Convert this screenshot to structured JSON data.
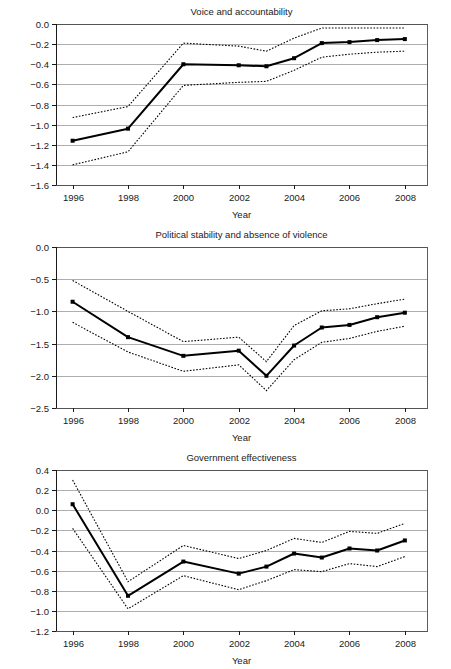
{
  "figure": {
    "background": "#ffffff",
    "line_color": "#000000",
    "grid_color": "#8c8c8c",
    "frame_color": "#4a4a4a"
  },
  "panels": [
    {
      "name": "voice-and-accountability",
      "title": "Voice and accountability",
      "xlabel": "Year",
      "yticks": [
        "0.0",
        "-0.2",
        "-0.4",
        "-0.6",
        "-0.8",
        "-1.0",
        "-1.2",
        "-1.4",
        "-1.6"
      ],
      "xticks": [
        "1996",
        "1998",
        "2000",
        "2002",
        "2004",
        "2006",
        "2008"
      ]
    },
    {
      "name": "political-stability-and-absence-of-violence",
      "title": "Political stability and absence of violence",
      "xlabel": "Year",
      "yticks": [
        "0.0",
        "-0.5",
        "-1.0",
        "-1.5",
        "-2.0",
        "-2.5"
      ],
      "xticks": [
        "1996",
        "1998",
        "2000",
        "2002",
        "2004",
        "2006",
        "2008"
      ]
    },
    {
      "name": "government-effectiveness",
      "title": "Government effectiveness",
      "xlabel": "Year",
      "yticks": [
        "0.4",
        "0.2",
        "0.0",
        "-0.2",
        "-0.4",
        "-0.6",
        "-0.8",
        "-1.0",
        "-1.2"
      ],
      "xticks": [
        "1996",
        "1998",
        "2000",
        "2002",
        "2004",
        "2006",
        "2008"
      ]
    }
  ],
  "chart_data": [
    {
      "type": "line",
      "title": "Voice and accountability",
      "xlabel": "Year",
      "ylabel": "",
      "xlim": [
        1995.4,
        2008.8
      ],
      "ylim": [
        -1.6,
        0.0
      ],
      "yticks": [
        0.0,
        -0.2,
        -0.4,
        -0.6,
        -0.8,
        -1.0,
        -1.2,
        -1.4,
        -1.6
      ],
      "xticks": [
        1996,
        1998,
        2000,
        2002,
        2004,
        2006,
        2008
      ],
      "grid": true,
      "legend": "none",
      "x": [
        1996,
        1998,
        2000,
        2002,
        2003,
        2004,
        2005,
        2006,
        2007,
        2008
      ],
      "series": [
        {
          "name": "Estimate",
          "style": "solid",
          "markers": true,
          "values": [
            -1.16,
            -1.04,
            -0.4,
            -0.41,
            -0.42,
            -0.34,
            -0.19,
            -0.18,
            -0.16,
            -0.15
          ]
        },
        {
          "name": "Upper confidence bound",
          "style": "dotted",
          "markers": false,
          "values": [
            -0.93,
            -0.82,
            -0.19,
            -0.22,
            -0.27,
            -0.14,
            -0.04,
            -0.04,
            -0.04,
            -0.04
          ]
        },
        {
          "name": "Lower confidence bound",
          "style": "dotted",
          "markers": false,
          "values": [
            -1.4,
            -1.27,
            -0.61,
            -0.58,
            -0.57,
            -0.46,
            -0.33,
            -0.3,
            -0.28,
            -0.27
          ]
        }
      ]
    },
    {
      "type": "line",
      "title": "Political stability and absence of violence",
      "xlabel": "Year",
      "ylabel": "",
      "xlim": [
        1995.4,
        2008.8
      ],
      "ylim": [
        -2.5,
        0.0
      ],
      "yticks": [
        0.0,
        -0.5,
        -1.0,
        -1.5,
        -2.0,
        -2.5
      ],
      "xticks": [
        1996,
        1998,
        2000,
        2002,
        2004,
        2006,
        2008
      ],
      "grid": true,
      "legend": "none",
      "x": [
        1996,
        1998,
        2000,
        2002,
        2003,
        2004,
        2005,
        2006,
        2007,
        2008
      ],
      "series": [
        {
          "name": "Estimate",
          "style": "solid",
          "markers": true,
          "values": [
            -0.85,
            -1.4,
            -1.69,
            -1.61,
            -2.0,
            -1.53,
            -1.25,
            -1.21,
            -1.09,
            -1.02
          ]
        },
        {
          "name": "Upper confidence bound",
          "style": "dotted",
          "markers": false,
          "values": [
            -0.52,
            -1.0,
            -1.47,
            -1.4,
            -1.78,
            -1.22,
            -0.99,
            -0.96,
            -0.88,
            -0.81
          ]
        },
        {
          "name": "Lower confidence bound",
          "style": "dotted",
          "markers": false,
          "values": [
            -1.17,
            -1.63,
            -1.93,
            -1.83,
            -2.23,
            -1.75,
            -1.48,
            -1.42,
            -1.31,
            -1.23
          ]
        }
      ]
    },
    {
      "type": "line",
      "title": "Government effectiveness",
      "xlabel": "Year",
      "ylabel": "",
      "xlim": [
        1995.4,
        2008.8
      ],
      "ylim": [
        -1.2,
        0.4
      ],
      "yticks": [
        0.4,
        0.2,
        0.0,
        -0.2,
        -0.4,
        -0.6,
        -0.8,
        -1.0,
        -1.2
      ],
      "xticks": [
        1996,
        1998,
        2000,
        2002,
        2004,
        2006,
        2008
      ],
      "grid": true,
      "legend": "none",
      "x": [
        1996,
        1998,
        2000,
        2002,
        2003,
        2004,
        2005,
        2006,
        2007,
        2008
      ],
      "series": [
        {
          "name": "Estimate",
          "style": "solid",
          "markers": true,
          "values": [
            0.06,
            -0.85,
            -0.51,
            -0.63,
            -0.56,
            -0.43,
            -0.47,
            -0.38,
            -0.4,
            -0.3
          ]
        },
        {
          "name": "Upper confidence bound",
          "style": "dotted",
          "markers": false,
          "values": [
            0.3,
            -0.71,
            -0.35,
            -0.48,
            -0.4,
            -0.28,
            -0.32,
            -0.21,
            -0.23,
            -0.13
          ]
        },
        {
          "name": "Lower confidence bound",
          "style": "dotted",
          "markers": false,
          "values": [
            -0.18,
            -0.98,
            -0.65,
            -0.79,
            -0.7,
            -0.59,
            -0.61,
            -0.53,
            -0.56,
            -0.46
          ]
        }
      ]
    }
  ]
}
